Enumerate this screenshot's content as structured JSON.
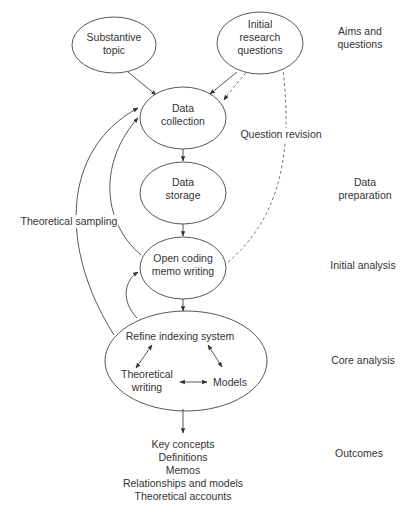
{
  "nodes": {
    "substantive_topic": {
      "line1": "Substantive",
      "line2": "topic"
    },
    "initial_questions": {
      "line1": "Initial",
      "line2": "research",
      "line3": "questions"
    },
    "data_collection": {
      "line1": "Data",
      "line2": "collection"
    },
    "data_storage": {
      "line1": "Data",
      "line2": "storage"
    },
    "open_coding": {
      "line1": "Open coding",
      "line2": "memo writing"
    },
    "core": {
      "refine": "Refine indexing system",
      "theoretical_writing_1": "Theoretical",
      "theoretical_writing_2": "writing",
      "models": "Models"
    }
  },
  "edge_labels": {
    "question_revision": "Question revision",
    "theoretical_sampling": "Theoretical sampling"
  },
  "outcomes": [
    "Key concepts",
    "Definitions",
    "Memos",
    "Relationships and models",
    "Theoretical accounts"
  ],
  "stages": {
    "aims_1": "Aims and",
    "aims_2": "questions",
    "prep_1": "Data",
    "prep_2": "preparation",
    "initial": "Initial analysis",
    "core": "Core analysis",
    "outcomes": "Outcomes"
  },
  "colors": {
    "stroke": "#444444",
    "text": "#333333",
    "background": "#ffffff"
  }
}
